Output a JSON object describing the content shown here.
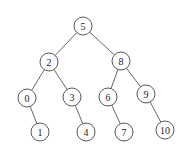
{
  "diagram": {
    "type": "binary-search-tree",
    "node_radius": 9,
    "nodes": [
      {
        "id": "n5",
        "label": "5",
        "x": 83,
        "y": 26
      },
      {
        "id": "n2",
        "label": "2",
        "x": 49,
        "y": 62
      },
      {
        "id": "n8",
        "label": "8",
        "x": 121,
        "y": 61
      },
      {
        "id": "n0",
        "label": "0",
        "x": 27,
        "y": 98
      },
      {
        "id": "n3",
        "label": "3",
        "x": 72,
        "y": 97
      },
      {
        "id": "n6",
        "label": "6",
        "x": 108,
        "y": 97
      },
      {
        "id": "n9",
        "label": "9",
        "x": 146,
        "y": 94
      },
      {
        "id": "n1",
        "label": "1",
        "x": 40,
        "y": 132
      },
      {
        "id": "n4",
        "label": "4",
        "x": 86,
        "y": 132
      },
      {
        "id": "n7",
        "label": "7",
        "x": 124,
        "y": 132
      },
      {
        "id": "n10",
        "label": "10",
        "x": 165,
        "y": 130
      }
    ],
    "edges": [
      {
        "from": "n5",
        "to": "n2"
      },
      {
        "from": "n5",
        "to": "n8"
      },
      {
        "from": "n2",
        "to": "n0"
      },
      {
        "from": "n2",
        "to": "n3"
      },
      {
        "from": "n8",
        "to": "n6"
      },
      {
        "from": "n8",
        "to": "n9"
      },
      {
        "from": "n0",
        "to": "n1"
      },
      {
        "from": "n3",
        "to": "n4"
      },
      {
        "from": "n6",
        "to": "n7"
      },
      {
        "from": "n9",
        "to": "n10"
      }
    ]
  }
}
